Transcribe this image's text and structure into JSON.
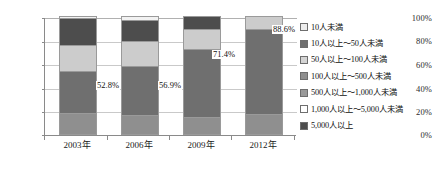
{
  "chart_data": {
    "type": "bar",
    "stacked": true,
    "title": "",
    "xlabel": "",
    "ylabel": "",
    "ylim": [
      0,
      100
    ],
    "ytick_labels": [
      "0%",
      "20%",
      "40%",
      "60%",
      "80%",
      "100%"
    ],
    "ytick_values": [
      0,
      20,
      40,
      60,
      80,
      100
    ],
    "grid": true,
    "legend_position": "right",
    "categories": [
      "2003年",
      "2006年",
      "2009年",
      "2012年"
    ],
    "series": [
      {
        "name": "10人未満",
        "color": "#ededed",
        "values": [
          0.0,
          0.0,
          0.0,
          0.0
        ]
      },
      {
        "name": "10人以上～50人未満",
        "color": "#8f8f8f",
        "values": [
          17.0,
          15.5,
          13.5,
          16.0
        ]
      },
      {
        "name": "50人以上～100人未満",
        "color": "#d4d4d4",
        "values": [
          0.0,
          0.0,
          0.0,
          0.0
        ]
      },
      {
        "name": "100人以上～500人未満",
        "color": "#6f6f6f",
        "values": [
          35.8,
          41.4,
          57.9,
          72.6
        ]
      },
      {
        "name": "500人以上～1,000人未満",
        "color": "#9a9a9a",
        "values": [
          0.0,
          0.0,
          0.0,
          0.0
        ]
      },
      {
        "name": "1,000人以上～5,000人未満",
        "color": "#cccccc",
        "values": [
          22.4,
          22.1,
          17.2,
          11.4
        ]
      },
      {
        "name": "5,000人以上",
        "color": "#4d4d4d",
        "values": [
          22.8,
          18.0,
          11.4,
          0.0
        ]
      }
    ],
    "top_cap": {
      "color": "#f2f2f2",
      "values": [
        2.0,
        3.0,
        0.0,
        0.0
      ]
    },
    "data_labels": [
      {
        "category": "2003年",
        "value": "52.8%"
      },
      {
        "category": "2006年",
        "value": "56.9%"
      },
      {
        "category": "2009年",
        "value": "71.4%"
      },
      {
        "category": "2012年",
        "value": "88.6%"
      }
    ],
    "legend": [
      "10人未満",
      "10人以上～50人未満",
      "50人以上～100人未満",
      "100人以上～500人未満",
      "500人以上～1,000人未満",
      "1,000人以上～5,000人未満",
      "5,000人以上"
    ]
  },
  "legend_colors": [
    "#ededed",
    "#6f6f6f",
    "#d4d4d4",
    "#8f8f8f",
    "#9a9a9a",
    "#ffffff",
    "#4d4d4d"
  ],
  "axis_color": "#8a8a8a",
  "grid_color": "#c9c9c9"
}
